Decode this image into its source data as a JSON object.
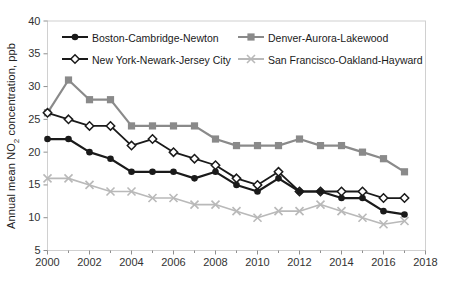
{
  "chart_data": {
    "type": "line",
    "title": "",
    "xlabel": "",
    "ylabel": "Annual mean NO2 concentration, ppb",
    "ylabel_parts": {
      "pre": "Annual mean NO",
      "sub": "2",
      "post": " concentration, ppb"
    },
    "xlim": [
      2000,
      2018
    ],
    "ylim": [
      5,
      40
    ],
    "x_ticks": [
      2000,
      2002,
      2004,
      2006,
      2008,
      2010,
      2012,
      2014,
      2016,
      2018
    ],
    "y_ticks": [
      5,
      10,
      15,
      20,
      25,
      30,
      35,
      40
    ],
    "grid": false,
    "legend_position": "top-inside-two-columns",
    "x": [
      2000,
      2001,
      2002,
      2003,
      2004,
      2005,
      2006,
      2007,
      2008,
      2009,
      2010,
      2011,
      2012,
      2013,
      2014,
      2015,
      2016,
      2017
    ],
    "series": [
      {
        "name": "Boston-Cambridge-Newton",
        "marker": "circle",
        "color": "#1a1a1a",
        "line_width": 2.2,
        "values": [
          22,
          22,
          20,
          19,
          17,
          17,
          17,
          16,
          17,
          15,
          14,
          16,
          14,
          14,
          13,
          13,
          11,
          10.5
        ]
      },
      {
        "name": "New York-Newark-Jersey City",
        "marker": "diamond-open",
        "color": "#1a1a1a",
        "line_width": 1.8,
        "values": [
          26,
          25,
          24,
          24,
          21,
          22,
          20,
          19,
          18,
          16,
          15,
          17,
          14,
          14,
          14,
          14,
          13,
          13
        ]
      },
      {
        "name": "Denver-Aurora-Lakewood",
        "marker": "square",
        "color": "#8a8a8a",
        "line_width": 2.2,
        "values": [
          26,
          31,
          28,
          28,
          24,
          24,
          24,
          24,
          22,
          21,
          21,
          21,
          22,
          21,
          21,
          20,
          19,
          17
        ]
      },
      {
        "name": "San Francisco-Oakland-Hayward",
        "marker": "x",
        "color": "#b9b9b9",
        "line_width": 1.6,
        "values": [
          16,
          16,
          15,
          14,
          14,
          13,
          13,
          12,
          12,
          11,
          10,
          11,
          11,
          12,
          11,
          10,
          9,
          9.5
        ]
      }
    ],
    "axis_color": "#8f8f8f",
    "border_color": "#d0d0d0",
    "tick_label_color": "#333333"
  }
}
